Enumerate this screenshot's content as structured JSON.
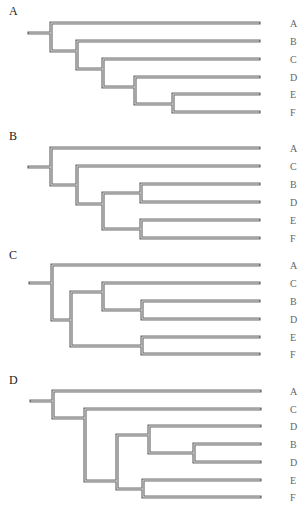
{
  "figure": {
    "panels": [
      {
        "id": "A",
        "label": "A",
        "label_y": 4,
        "leaves": [
          {
            "label": "A",
            "y": 23
          },
          {
            "label": "B",
            "y": 41
          },
          {
            "label": "C",
            "y": 59
          },
          {
            "label": "D",
            "y": 77
          },
          {
            "label": "E",
            "y": 94
          },
          {
            "label": "F",
            "y": 112
          }
        ],
        "newick": "(A,(B,(C,(D,(E,F)))))",
        "edges": "M29,33 L51,33 M51,23 L51,51 M51,23 L259,23 M51,51 L77,51 M77,41 L77,69 M77,41 L259,41 M77,69 L103,69 M103,59 L103,87 M103,59 L259,59 M103,87 L135,87 M135,77 L135,104 M135,77 L259,77 M135,104 L173,104 M173,94 L173,112 M173,94 L259,94 M173,112 L259,112"
      },
      {
        "id": "B",
        "label": "B",
        "label_y": 129,
        "leaves": [
          {
            "label": "A",
            "y": 148
          },
          {
            "label": "C",
            "y": 166
          },
          {
            "label": "B",
            "y": 184
          },
          {
            "label": "D",
            "y": 202
          },
          {
            "label": "E",
            "y": 220
          },
          {
            "label": "F",
            "y": 238
          }
        ],
        "newick": "(A,(C,((B,D),(E,F))))",
        "edges": "M29,167 L51,167 M51,148 L51,185 M51,148 L259,148 M51,185 L77,185 M77,166 L77,204 M77,166 L259,166 M77,204 L103,204 M103,193 L103,229 M103,193 L141,193 M141,184 L141,202 M141,184 L259,184 M141,202 L259,202 M103,229 L141,229 M141,220 L141,238 M141,220 L259,220 M141,238 L259,238"
      },
      {
        "id": "C",
        "label": "C",
        "label_y": 248,
        "leaves": [
          {
            "label": "A",
            "y": 265
          },
          {
            "label": "C",
            "y": 283
          },
          {
            "label": "B",
            "y": 301
          },
          {
            "label": "D",
            "y": 319
          },
          {
            "label": "E",
            "y": 337
          },
          {
            "label": "F",
            "y": 354
          }
        ],
        "newick": "(A,((C,(B,D)),(E,F)))",
        "edges": "M30,283 L52,283 M52,265 L52,320 M52,265 L259,265 M52,320 L71,320 M71,292 L71,346 M71,292 L103,292 M103,283 L103,310 M103,283 L259,283 M103,310 L142,310 M142,301 L142,319 M142,301 L259,301 M142,319 L259,319 M71,346 L142,346 M142,337 L142,354 M142,337 L259,337 M142,354 L259,354"
      },
      {
        "id": "D",
        "label": "D",
        "label_y": 373,
        "leaves": [
          {
            "label": "A",
            "y": 391
          },
          {
            "label": "C",
            "y": 409
          },
          {
            "label": "D",
            "y": 426
          },
          {
            "label": "B",
            "y": 444
          },
          {
            "label": "D",
            "y": 462
          },
          {
            "label": "E",
            "y": 480
          },
          {
            "label": "F",
            "y": 497
          }
        ],
        "newick": "(A,(C,((D,(B,D)),(E,F))))",
        "edges": "M31,401 L53,401 M53,391 L53,418 M53,391 L260,391 M53,418 L85,418 M85,409 L85,481 M85,409 L260,409 M85,481 L117,481 M117,435 L117,489 M117,435 L149,435 M149,426 L149,453 M149,426 L260,426 M149,453 L194,453 M194,444 L194,462 M194,444 L260,444 M194,462 L260,462 M117,489 L143,489 M143,480 L143,497 M143,480 L260,480 M143,497 L260,497"
      }
    ],
    "style": {
      "edge_color": "#6f6f6f",
      "edge_inner_color": "#e6e6e6",
      "label_color": "#666666",
      "panel_label_color": "#222222"
    }
  }
}
